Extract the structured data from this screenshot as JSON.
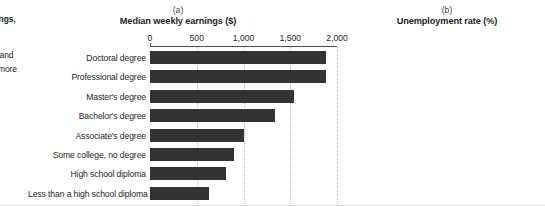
{
  "margin_text": {
    "fragment_earnings": "rnings,",
    "fragment_and": ", and",
    "fragment_more": "r more"
  },
  "categories": [
    "Doctoral degree",
    "Professional degree",
    "Master's degree",
    "Bachelor's degree",
    "Associate's degree",
    "Some college, no degree",
    "High school diploma",
    "Less than a high school diploma"
  ],
  "panel_a": {
    "tag": "(a)",
    "title": "Median weekly earnings ($)",
    "tick_labels": [
      "0",
      "500",
      "1,000",
      "1,500",
      "2,000"
    ]
  },
  "panel_b": {
    "tag": "(b)",
    "title": "Unemployment rate (%)",
    "tick_labels": [
      "0",
      "2",
      "4",
      "6",
      "8",
      "10",
      "12"
    ]
  },
  "colors": {
    "bar_earnings": "#333333",
    "bar_unemployment": "#808080",
    "axis": "#4d4d4d",
    "gridline": "#b9b9b9",
    "text": "#231f20"
  },
  "chart_data": [
    {
      "type": "bar",
      "orientation": "horizontal",
      "title": "Median weekly earnings ($)",
      "panel_tag": "(a)",
      "xlabel": "Median weekly earnings ($)",
      "ylabel": "",
      "xlim": [
        0,
        2000
      ],
      "xticks": [
        0,
        500,
        1000,
        1500,
        2000
      ],
      "xtick_labels": [
        "0",
        "500",
        "1,000",
        "1,500",
        "2,000"
      ],
      "grid": true,
      "legend": false,
      "categories": [
        "Doctoral degree",
        "Professional degree",
        "Master's degree",
        "Bachelor's degree",
        "Associate's degree",
        "Some college, no degree",
        "High school diploma",
        "Less than a high school diploma"
      ],
      "values": [
        1885,
        1880,
        1545,
        1334,
        1005,
        899,
        809,
        626
      ]
    },
    {
      "type": "bar",
      "orientation": "horizontal",
      "title": "Unemployment rate (%)",
      "panel_tag": "(b)",
      "xlabel": "Unemployment rate (%)",
      "ylabel": "",
      "xlim": [
        0,
        12
      ],
      "xticks": [
        0,
        2,
        4,
        6,
        8,
        10,
        12
      ],
      "xtick_labels": [
        "0",
        "2",
        "4",
        "6",
        "8",
        "10",
        "12"
      ],
      "grid": true,
      "legend": false,
      "categories": [
        "Doctoral degree",
        "Professional degree",
        "Master's degree",
        "Bachelor's degree",
        "Associate's degree",
        "Some college, no degree",
        "High school diploma",
        "Less than a high school diploma"
      ],
      "values": [
        2.0,
        2.3,
        3.4,
        4.5,
        5.5,
        6.5,
        7.7,
        11.0
      ]
    }
  ]
}
